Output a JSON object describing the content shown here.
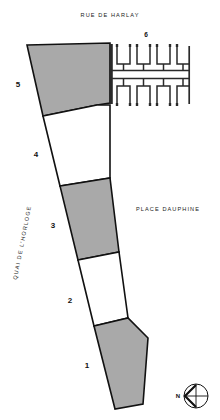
{
  "plan": {
    "title_street_top": "RUE DE HARLAY",
    "label_place": "PLACE DAUPHINE",
    "label_quai": "QUAI DE L'HORLOGE",
    "colors": {
      "fill_hatched": "#a9a9a9",
      "fill_empty": "#ffffff",
      "stroke": "#111111",
      "background": "#ffffff",
      "comb_stroke": "#2a2a2a"
    },
    "parcels": [
      {
        "number": "1",
        "fill": "hatched",
        "label_x": 62,
        "label_y": 368
      },
      {
        "number": "2",
        "fill": "empty",
        "label_x": 70,
        "label_y": 303
      },
      {
        "number": "3",
        "fill": "hatched",
        "label_x": 53,
        "label_y": 228
      },
      {
        "number": "4",
        "fill": "empty",
        "label_x": 36,
        "label_y": 157
      },
      {
        "number": "5",
        "fill": "hatched",
        "label_x": 18,
        "label_y": 87
      },
      {
        "number": "6",
        "fill": "comb",
        "label_x": 146,
        "label_y": 36
      }
    ],
    "compass": {
      "letter": "N",
      "direction": "west-pointing-arrow"
    }
  }
}
